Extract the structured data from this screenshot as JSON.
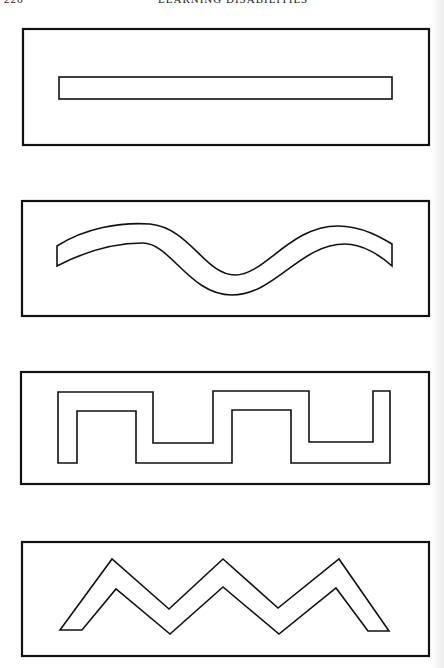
{
  "page": {
    "running_head": {
      "page_number": "226",
      "title": "LEARNING DISABILITIES"
    },
    "figures": [
      {
        "name": "straight-line-track",
        "shape": "straight-bar"
      },
      {
        "name": "curved-wave-track",
        "shape": "wave"
      },
      {
        "name": "square-wave-track",
        "shape": "square-wave"
      },
      {
        "name": "zigzag-track",
        "shape": "zigzag"
      }
    ],
    "colors": {
      "ink": "#111111",
      "paper": "#ffffff"
    }
  }
}
